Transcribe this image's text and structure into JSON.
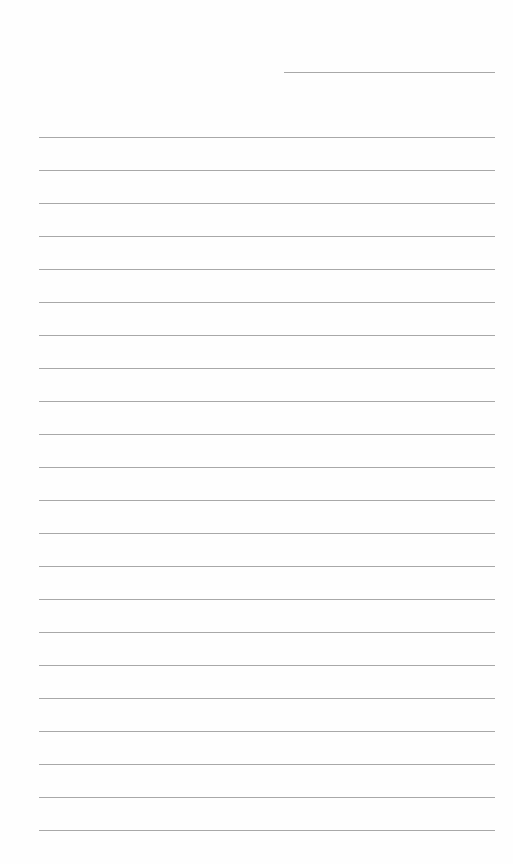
{
  "document": {
    "type": "lined-paper",
    "date_line": {
      "present": true,
      "text": ""
    },
    "ruled_lines": {
      "count": 22,
      "first_y": 137,
      "spacing": 33,
      "color": "#a8a8a8",
      "text": []
    },
    "background": "#ffffff"
  }
}
